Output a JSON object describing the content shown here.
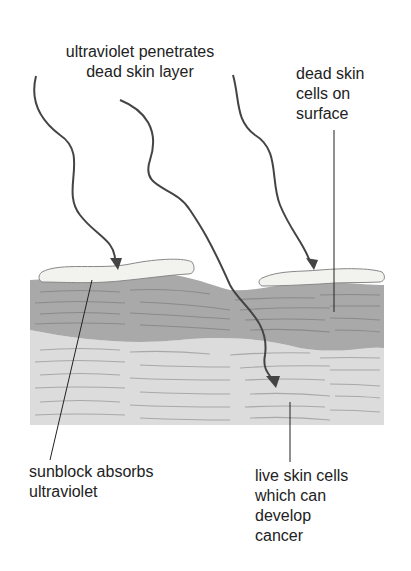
{
  "diagram": {
    "labels": {
      "uv_penetrates_line1": "ultraviolet penetrates",
      "uv_penetrates_line2": "dead skin layer",
      "dead_cells_line1": "dead skin",
      "dead_cells_line2": "cells on",
      "dead_cells_line3": "surface",
      "sunblock_line1": "sunblock absorbs",
      "sunblock_line2": "ultraviolet",
      "live_cells_line1": "live skin cells",
      "live_cells_line2": "which can",
      "live_cells_line3": "develop",
      "live_cells_line4": "cancer"
    },
    "colors": {
      "dead_layer": "#a9a9a9",
      "live_layer": "#dcdcdc",
      "sunblock": "#f2f2ef",
      "arrow": "#444444",
      "texture_dark": "#8a8a8a",
      "texture_light": "#a8a8a8"
    }
  }
}
